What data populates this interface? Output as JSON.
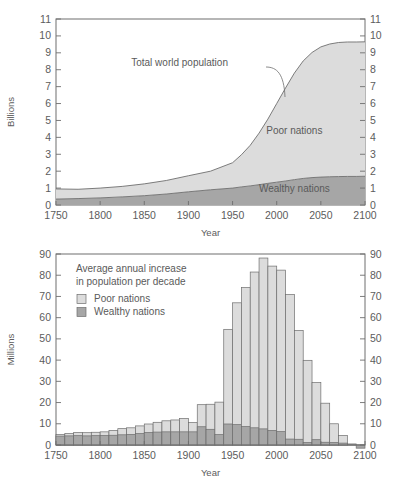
{
  "figure": {
    "background": "#ffffff",
    "colors": {
      "poor": "#dcdcdc",
      "wealthy": "#a6a6a6",
      "outline": "#6e6e6e",
      "text": "#5a5a5a",
      "axis": "#6e6e6e"
    }
  },
  "chart_data": [
    {
      "type": "area",
      "id": "top-chart",
      "title": "",
      "xlabel": "Year",
      "ylabel": "Billions",
      "xlim": [
        1750,
        2100
      ],
      "ylim": [
        0,
        11
      ],
      "xticks": [
        1750,
        1800,
        1850,
        1900,
        1950,
        2000,
        2050,
        2100
      ],
      "yticks": [
        0,
        1,
        2,
        3,
        4,
        5,
        6,
        7,
        8,
        9,
        10,
        11
      ],
      "grid": false,
      "legend_position": "inline-annotation",
      "annotations": [
        {
          "text": "Total world population",
          "x": 1890,
          "y": 8.2
        },
        {
          "text": "Poor nations",
          "x": 2020,
          "y": 4.2
        },
        {
          "text": "Wealthy nations",
          "x": 2020,
          "y": 0.75
        }
      ],
      "x": [
        1750,
        1775,
        1800,
        1825,
        1850,
        1875,
        1900,
        1925,
        1950,
        1960,
        1970,
        1980,
        1990,
        2000,
        2010,
        2020,
        2030,
        2040,
        2050,
        2060,
        2070,
        2080,
        2090,
        2100
      ],
      "series": [
        {
          "name": "Wealthy nations",
          "color": "#a6a6a6",
          "values": [
            0.35,
            0.38,
            0.42,
            0.48,
            0.55,
            0.65,
            0.78,
            0.9,
            1.0,
            1.07,
            1.13,
            1.2,
            1.28,
            1.35,
            1.42,
            1.5,
            1.57,
            1.62,
            1.65,
            1.67,
            1.68,
            1.69,
            1.69,
            1.7
          ]
        },
        {
          "name": "Poor nations",
          "color": "#dcdcdc",
          "values": [
            0.6,
            0.55,
            0.58,
            0.62,
            0.7,
            0.8,
            0.95,
            1.1,
            1.5,
            1.9,
            2.4,
            3.05,
            3.8,
            4.65,
            5.5,
            6.3,
            6.95,
            7.4,
            7.7,
            7.85,
            7.93,
            7.95,
            7.95,
            7.95
          ]
        }
      ],
      "total_world_population": [
        0.95,
        0.93,
        1.0,
        1.1,
        1.25,
        1.45,
        1.73,
        2.0,
        2.5,
        2.97,
        3.53,
        4.25,
        5.08,
        6.0,
        6.92,
        7.8,
        8.52,
        9.02,
        9.35,
        9.52,
        9.61,
        9.64,
        9.64,
        9.65
      ]
    },
    {
      "type": "bar",
      "id": "bottom-chart",
      "title": "Average annual increase in population per decade",
      "xlabel": "Year",
      "ylabel": "Millions",
      "xlim": [
        1750,
        2100
      ],
      "ylim": [
        -3,
        90
      ],
      "xticks": [
        1750,
        1800,
        1850,
        1900,
        1950,
        2000,
        2050,
        2100
      ],
      "yticks": [
        0,
        10,
        20,
        30,
        40,
        50,
        60,
        70,
        80,
        90
      ],
      "grid": false,
      "stacked": true,
      "legend_position": "upper-left",
      "legend": [
        {
          "label": "Poor nations",
          "color": "#dcdcdc"
        },
        {
          "label": "Wealthy nations",
          "color": "#a6a6a6"
        }
      ],
      "categories": [
        1750,
        1760,
        1770,
        1780,
        1790,
        1800,
        1810,
        1820,
        1830,
        1840,
        1850,
        1860,
        1870,
        1880,
        1890,
        1900,
        1910,
        1920,
        1930,
        1940,
        1950,
        1960,
        1970,
        1980,
        1990,
        2000,
        2010,
        2020,
        2030,
        2040,
        2050,
        2060,
        2070,
        2080,
        2090
      ],
      "series": [
        {
          "name": "Wealthy nations",
          "color": "#a6a6a6",
          "values": [
            4.2,
            4.3,
            4.4,
            4.3,
            4.4,
            4.5,
            4.6,
            4.8,
            5.0,
            5.4,
            5.9,
            6.1,
            6.2,
            6.2,
            6.2,
            6.2,
            8.6,
            7.4,
            4.9,
            9.9,
            9.6,
            8.7,
            8.1,
            7.6,
            6.9,
            6.3,
            2.8,
            2.7,
            1.2,
            2.5,
            1.3,
            1.2,
            0.9,
            0.5,
            -1.5
          ]
        },
        {
          "name": "Poor nations",
          "color": "#dcdcdc",
          "values": [
            0.7,
            1.1,
            1.5,
            1.5,
            1.6,
            1.7,
            2.3,
            2.9,
            3.1,
            3.6,
            4.0,
            4.6,
            5.2,
            5.6,
            6.3,
            4.4,
            10.4,
            11.8,
            15.3,
            44.6,
            57.4,
            65.5,
            73.4,
            80.5,
            77.4,
            76.1,
            68.1,
            51.3,
            38.7,
            26.9,
            18.4,
            8.8,
            3.6,
            0.0,
            0.0
          ]
        }
      ],
      "totals": [
        4.9,
        5.4,
        5.9,
        5.8,
        6.0,
        6.2,
        6.9,
        7.7,
        8.1,
        9.0,
        9.9,
        10.7,
        11.4,
        11.8,
        12.5,
        10.6,
        19.0,
        19.2,
        20.2,
        54.5,
        67.0,
        74.2,
        81.5,
        88.1,
        84.3,
        82.4,
        70.9,
        54.0,
        39.9,
        29.4,
        19.7,
        10.0,
        4.5,
        0.5,
        -1.5
      ]
    }
  ]
}
